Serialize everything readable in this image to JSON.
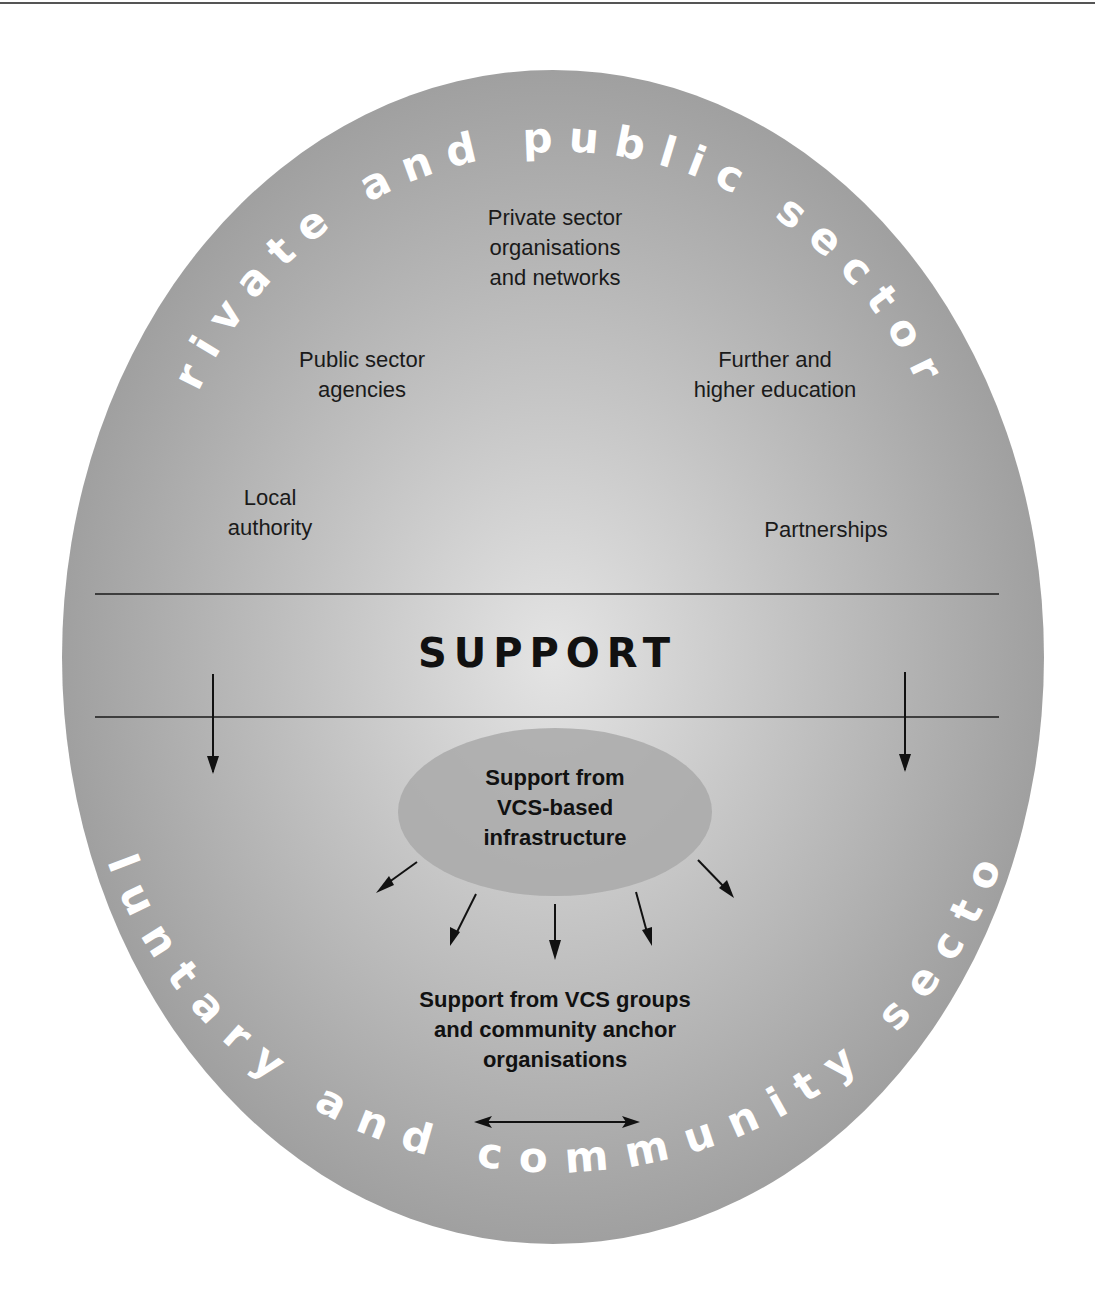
{
  "diagram": {
    "outer_top_arc_text": "private and public sectors",
    "outer_bottom_arc_text": "voluntary and community sectors",
    "center_band_label": "SUPPORT",
    "upper_nodes": [
      {
        "id": "private-sector",
        "label": "Private sector\norganisations\nand networks"
      },
      {
        "id": "public-sector",
        "label": "Public sector\nagencies"
      },
      {
        "id": "further-higher-ed",
        "label": "Further and\nhigher education"
      },
      {
        "id": "local-authority",
        "label": "Local\nauthority"
      },
      {
        "id": "partnerships",
        "label": "Partnerships"
      }
    ],
    "infrastructure_node": {
      "label": "Support from\nVCS-based\ninfrastructure"
    },
    "groups_node": {
      "label": "Support from VCS groups\nand community anchor\norganisations"
    },
    "colors": {
      "ellipse_edge": "#9a9a9a",
      "ellipse_center": "#e2e2e2",
      "inner_ellipse": "#a8a8a8",
      "arc_text": "#ffffff",
      "lines": "#1a1a1a"
    }
  }
}
